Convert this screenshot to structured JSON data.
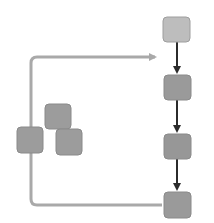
{
  "diagram": {
    "type": "flow",
    "colors": {
      "background": "#ffffff",
      "box_light": "#bdbdbd",
      "box_dark": "#9a9a9a",
      "box_border": "#8a8a8a",
      "feedback_line": "#a9a9a9",
      "flow_arrow": "#2b2b2b"
    },
    "chain_nodes": [
      {
        "id": "node-1",
        "x": 163,
        "y": 17,
        "w": 27,
        "h": 25,
        "shade": "light"
      },
      {
        "id": "node-2",
        "x": 164,
        "y": 75,
        "w": 27,
        "h": 25,
        "shade": "dark"
      },
      {
        "id": "node-3",
        "x": 164,
        "y": 134,
        "w": 27,
        "h": 25,
        "shade": "dark"
      },
      {
        "id": "node-4",
        "x": 164,
        "y": 192,
        "w": 27,
        "h": 26,
        "shade": "dark"
      }
    ],
    "side_nodes": [
      {
        "id": "loop-node",
        "x": 17,
        "y": 127,
        "w": 26,
        "h": 26
      },
      {
        "id": "cluster-node-1",
        "x": 45,
        "y": 104,
        "w": 26,
        "h": 25
      },
      {
        "id": "cluster-node-2",
        "x": 56,
        "y": 129,
        "w": 26,
        "h": 26
      }
    ],
    "edges": [
      {
        "from": "node-1",
        "to": "node-2",
        "style": "dark-arrow"
      },
      {
        "from": "node-2",
        "to": "node-3",
        "style": "dark-arrow"
      },
      {
        "from": "node-3",
        "to": "node-4",
        "style": "dark-arrow"
      },
      {
        "from": "node-4",
        "to": "top-of-chain",
        "style": "gray-feedback-loop",
        "via": "loop-node"
      }
    ]
  }
}
